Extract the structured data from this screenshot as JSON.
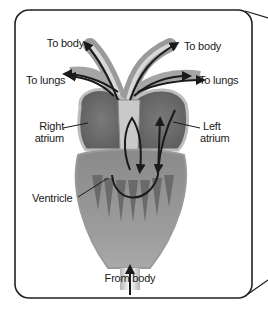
{
  "diagram": {
    "type": "amphibian-three-chambered-heart",
    "labels": {
      "to_body_left": "To body",
      "to_body_right": "To body",
      "to_lungs_left": "To lungs",
      "to_lungs_right": "To lungs",
      "right_atrium_line1": "Right",
      "right_atrium_line2": "atrium",
      "left_atrium_line1": "Left",
      "left_atrium_line2": "atrium",
      "ventricle": "Ventricle",
      "from_body": "From body"
    },
    "colors": {
      "frame": "#222222",
      "tissue_light": "#bdbdbd",
      "tissue_mid": "#8f8f8f",
      "tissue_dark": "#5e5e5e",
      "arrow": "#1a1a1a",
      "background": "#ffffff"
    }
  }
}
